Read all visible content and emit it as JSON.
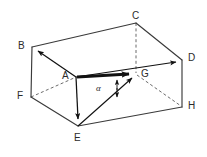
{
  "figure": {
    "type": "3d-box-diagram",
    "canvas": {
      "width": 207,
      "height": 157,
      "background": "#ffffff"
    },
    "colors": {
      "stroke": "#3a3a3a",
      "stroke_light": "#5a5a5a",
      "vector": "#111111",
      "label": "#2b2b2b",
      "background": "#ffffff"
    },
    "vertices": [
      {
        "name": "A",
        "label": "A",
        "x": 76,
        "y": 77,
        "label_x": 62,
        "label_y": 71,
        "hidden": false
      },
      {
        "name": "B",
        "label": "B",
        "x": 32,
        "y": 47,
        "label_x": 18,
        "label_y": 41,
        "hidden": false
      },
      {
        "name": "C",
        "label": "C",
        "x": 136,
        "y": 23,
        "label_x": 132,
        "label_y": 11,
        "hidden": false
      },
      {
        "name": "D",
        "label": "D",
        "x": 182,
        "y": 60,
        "label_x": 188,
        "label_y": 53,
        "hidden": false
      },
      {
        "name": "E",
        "label": "E",
        "x": 78,
        "y": 126,
        "label_x": 74,
        "label_y": 133,
        "hidden": false
      },
      {
        "name": "F",
        "label": "F",
        "x": 31,
        "y": 97,
        "label_x": 17,
        "label_y": 91,
        "hidden": false
      },
      {
        "name": "G",
        "label": "G",
        "x": 136,
        "y": 74,
        "label_x": 141,
        "label_y": 69,
        "hidden": false
      },
      {
        "name": "H",
        "label": "H",
        "x": 182,
        "y": 107,
        "label_x": 188,
        "label_y": 101,
        "hidden": false
      }
    ],
    "edges": [
      {
        "from": "B",
        "to": "C",
        "style": "solid"
      },
      {
        "from": "C",
        "to": "D",
        "style": "solid"
      },
      {
        "from": "B",
        "to": "A",
        "style": "solid"
      },
      {
        "from": "A",
        "to": "D",
        "style": "solid"
      },
      {
        "from": "B",
        "to": "F",
        "style": "solid"
      },
      {
        "from": "D",
        "to": "H",
        "style": "solid"
      },
      {
        "from": "A",
        "to": "E",
        "style": "solid"
      },
      {
        "from": "F",
        "to": "E",
        "style": "solid"
      },
      {
        "from": "E",
        "to": "H",
        "style": "solid"
      },
      {
        "from": "C",
        "to": "G",
        "style": "dashed"
      },
      {
        "from": "F",
        "to": "A",
        "style": "dashed"
      },
      {
        "from": "G",
        "to": "H",
        "style": "dashed"
      },
      {
        "from": "F",
        "to": "G",
        "style": "dashed"
      }
    ],
    "vectors": [
      {
        "name": "AG",
        "from": "A",
        "to": "G",
        "style": "thick",
        "label": ""
      },
      {
        "name": "AB",
        "from": "A",
        "to": "B",
        "style": "thin",
        "label": ""
      },
      {
        "name": "AD",
        "from": "A",
        "to": "D",
        "style": "thin",
        "label": ""
      },
      {
        "name": "AE",
        "from": "A",
        "to": "E",
        "style": "thin",
        "label": ""
      },
      {
        "name": "EG",
        "from": "E",
        "to": "G",
        "style": "thin",
        "label": ""
      }
    ],
    "angle": {
      "symbol": "α",
      "label_x": 96,
      "label_y": 84,
      "at_vertex": "G",
      "between": [
        "AG",
        "EG"
      ],
      "marker": "double-headed-arrow",
      "marker_x": 117,
      "marker_top_y": 78,
      "marker_bottom_y": 99
    }
  }
}
